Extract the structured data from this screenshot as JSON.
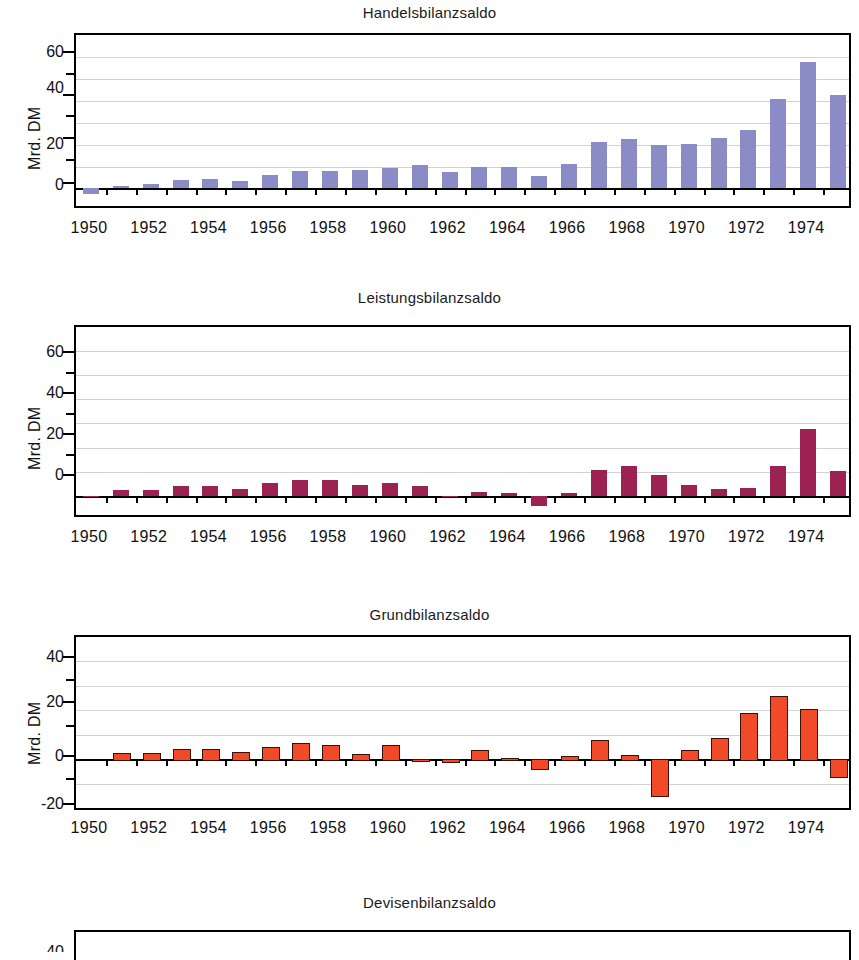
{
  "figure": {
    "ylabel": "Mrd. DM",
    "x_tick_labels": [
      "1950",
      "1952",
      "1954",
      "1956",
      "1958",
      "1960",
      "1962",
      "1964",
      "1966",
      "1968",
      "1970",
      "1972",
      "1974"
    ],
    "colors": {
      "handelsbilanz": "#8b8bc6",
      "leistungsbilanz": "#9c2252",
      "grundbilanz": "#f04a28",
      "grundbilanz_outline": "#3a1008",
      "axis": "#000000",
      "grid": "#d2d2d2",
      "background": "#ffffff"
    }
  },
  "chart_data": [
    {
      "type": "bar",
      "title": "Handelsbilanzsaldo",
      "xlabel": "",
      "ylabel": "Mrd. DM",
      "ylim": [
        -8,
        70
      ],
      "ytick_labels": [
        "0",
        "20",
        "40",
        "60"
      ],
      "ytick_values": [
        0,
        20,
        40,
        60
      ],
      "yminor_values": [
        10,
        30,
        50
      ],
      "grid": true,
      "legend": "none",
      "color": "#8b8bc6",
      "categories": [
        "1950",
        "1951",
        "1952",
        "1953",
        "1954",
        "1955",
        "1956",
        "1957",
        "1958",
        "1959",
        "1960",
        "1961",
        "1962",
        "1963",
        "1964",
        "1965",
        "1966",
        "1967",
        "1968",
        "1969",
        "1970",
        "1971",
        "1972",
        "1973",
        "1974",
        "1975"
      ],
      "values": [
        -2.5,
        1.1,
        2.1,
        3.8,
        4.2,
        3.6,
        6.2,
        8.0,
        8.1,
        8.5,
        9.5,
        10.6,
        7.4,
        9.8,
        9.8,
        5.9,
        11.0,
        21.0,
        22.5,
        19.6,
        20.5,
        23.2,
        26.8,
        40.8,
        57.7,
        42.6
      ]
    },
    {
      "type": "bar",
      "title": "Leistungsbilanzsaldo",
      "xlabel": "",
      "ylabel": "Mrd. DM",
      "ylim": [
        -8,
        70
      ],
      "ytick_labels": [
        "0",
        "20",
        "40",
        "60"
      ],
      "ytick_values": [
        0,
        20,
        40,
        60
      ],
      "yminor_values": [
        10,
        30,
        50
      ],
      "grid": true,
      "legend": "none",
      "color": "#9c2252",
      "categories": [
        "1950",
        "1951",
        "1952",
        "1953",
        "1954",
        "1955",
        "1956",
        "1957",
        "1958",
        "1959",
        "1960",
        "1961",
        "1962",
        "1963",
        "1964",
        "1965",
        "1966",
        "1967",
        "1968",
        "1969",
        "1970",
        "1971",
        "1972",
        "1973",
        "1974",
        "1975"
      ],
      "values": [
        -0.6,
        2.4,
        2.5,
        4.2,
        4.2,
        2.6,
        5.1,
        6.4,
        6.4,
        4.6,
        5.3,
        4.0,
        -0.7,
        1.5,
        1.2,
        -4.2,
        1.3,
        10.7,
        12.5,
        8.5,
        4.5,
        2.7,
        3.2,
        12.5,
        27.5,
        10.3
      ]
    },
    {
      "type": "bar",
      "title": "Grundbilanzsaldo",
      "xlabel": "",
      "ylabel": "Mrd. DM",
      "ylim": [
        -20,
        50
      ],
      "ytick_labels": [
        "-20",
        "0",
        "20",
        "40"
      ],
      "ytick_values": [
        -20,
        0,
        20,
        40
      ],
      "yminor_values": [
        -10,
        10,
        30
      ],
      "grid": true,
      "legend": "none",
      "color": "#f04a28",
      "categories": [
        "1950",
        "1951",
        "1952",
        "1953",
        "1954",
        "1955",
        "1956",
        "1957",
        "1958",
        "1959",
        "1960",
        "1961",
        "1962",
        "1963",
        "1964",
        "1965",
        "1966",
        "1967",
        "1968",
        "1969",
        "1970",
        "1971",
        "1972",
        "1973",
        "1974",
        "1975"
      ],
      "values": [
        0.0,
        2.6,
        2.6,
        4.0,
        4.0,
        2.8,
        4.8,
        6.6,
        5.6,
        2.0,
        5.6,
        -0.1,
        -0.7,
        3.8,
        0.6,
        -3.5,
        1.2,
        7.8,
        1.5,
        -14.8,
        3.6,
        8.8,
        19.0,
        26.0,
        20.6,
        -7.0
      ]
    },
    {
      "type": "bar",
      "title": "Devisenbilanzsaldo",
      "xlabel": "",
      "ylabel": "Mrd. DM",
      "ylim": [
        -20,
        50
      ],
      "ytick_labels": [
        "40"
      ],
      "ytick_values": [
        40
      ],
      "yminor_values": [],
      "grid": true,
      "legend": "none",
      "color": "#f04a28",
      "note": "clipped at bottom of image - only title, top frame and partial '40' tick label visible",
      "categories": [],
      "values": []
    }
  ]
}
